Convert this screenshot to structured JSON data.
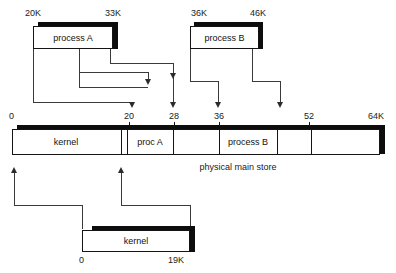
{
  "figure": {
    "caption": "physical main store"
  },
  "logical_spaces": [
    {
      "id": "process-a",
      "label": "process A",
      "base_label": "20K",
      "limit_label": "33K"
    },
    {
      "id": "process-b",
      "label": "process B",
      "base_label": "36K",
      "limit_label": "46K"
    }
  ],
  "kernel_space": {
    "id": "kernel",
    "label": "kernel",
    "base_label": "0",
    "limit_label": "19K"
  },
  "physical_store": {
    "caption": "physical main store",
    "axis_labels": [
      "0",
      "20",
      "28",
      "36",
      "52",
      "64K"
    ],
    "axis_values": [
      0,
      20,
      28,
      36,
      52,
      64
    ],
    "segments": [
      {
        "label": "kernel",
        "start": 0,
        "end": 19
      },
      {
        "label": "",
        "start": 19,
        "end": 20
      },
      {
        "label": "proc A",
        "start": 20,
        "end": 28
      },
      {
        "label": "",
        "start": 28,
        "end": 36
      },
      {
        "label": "process B",
        "start": 36,
        "end": 46
      },
      {
        "label": "",
        "start": 46,
        "end": 52
      },
      {
        "label": "",
        "start": 52,
        "end": 64
      }
    ]
  },
  "mappings": [
    {
      "from": "process A base 20K",
      "to": "physical 20"
    },
    {
      "from": "process A limit 33K",
      "to": "physical 28"
    },
    {
      "from": "process B base 36K",
      "to": "physical 36"
    },
    {
      "from": "process B limit 46K",
      "to": "physical 46"
    },
    {
      "from": "kernel base 0",
      "to": "physical 0"
    },
    {
      "from": "kernel limit 19K",
      "to": "physical 19"
    }
  ]
}
